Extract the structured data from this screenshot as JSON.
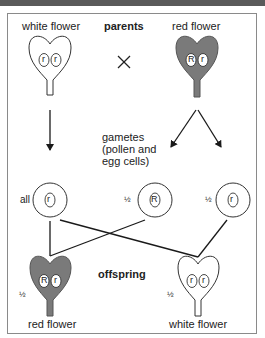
{
  "diagram": {
    "parents": {
      "heading": "parents",
      "left": {
        "label": "white flower",
        "alleles": [
          "r",
          "r"
        ],
        "fill": "#ffffff"
      },
      "right": {
        "label": "red flower",
        "alleles": [
          "R",
          "r"
        ],
        "fill": "#7a7a7a"
      },
      "cross_symbol": "×"
    },
    "gametes": {
      "heading_lines": [
        "gametes",
        "(pollen and",
        "egg cells)"
      ],
      "items": [
        {
          "fraction": "all",
          "allele": "r"
        },
        {
          "fraction": "½",
          "allele": "R"
        },
        {
          "fraction": "½",
          "allele": "r"
        }
      ]
    },
    "offspring": {
      "heading": "offspring",
      "left": {
        "label": "red flower",
        "fraction": "½",
        "alleles": [
          "R",
          "r"
        ],
        "fill": "#7a7a7a"
      },
      "right": {
        "label": "white flower",
        "fraction": "½",
        "alleles": [
          "r",
          "r"
        ],
        "fill": "#ffffff"
      }
    }
  },
  "colors": {
    "red_flower_fill": "#7a7a7a",
    "line": "#1a1a1a",
    "frame_border": "#8a8a8a",
    "top_bar": "#5a5a5a"
  }
}
